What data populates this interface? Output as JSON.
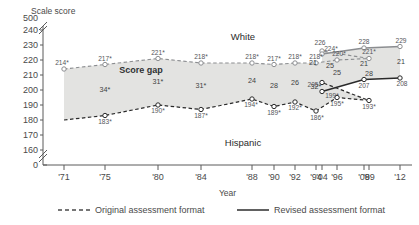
{
  "chart_data": {
    "type": "line",
    "title": "",
    "ylabel": "Scale score",
    "xlabel": "Year",
    "ylim": [
      160,
      240
    ],
    "yticks": [
      "500",
      "240",
      "230",
      "220",
      "210",
      "200",
      "190",
      "180",
      "170",
      "160",
      "0"
    ],
    "axis_break_top": true,
    "axis_break_bottom": true,
    "grid": false,
    "categories": [
      "'71",
      "'75",
      "'80",
      "'84",
      "'88",
      "'90",
      "'92",
      "'94",
      "'96",
      "'99",
      "'04",
      "'04",
      "'08",
      "'12"
    ],
    "xticks": [
      "'71",
      "'75",
      "'80",
      "'84",
      "'88",
      "'90",
      "'92",
      "'94",
      "'96",
      "'99",
      "'04",
      "'08",
      "'12"
    ],
    "series": [
      {
        "name": "White",
        "format": "original",
        "style": "dashed",
        "x": [
          "'71",
          "'75",
          "'80",
          "'84",
          "'88",
          "'90",
          "'92",
          "'94",
          "'96",
          "'99",
          "'04"
        ],
        "values": [
          214,
          217,
          221,
          218,
          218,
          217,
          218,
          218,
          220,
          221,
          226
        ],
        "labels": [
          "214*",
          "217*",
          "221*",
          "218*",
          "218*",
          "217*",
          "218*",
          "218*",
          "220*",
          "221*",
          "226"
        ]
      },
      {
        "name": "White",
        "format": "revised",
        "style": "solid",
        "x": [
          "'04",
          "'08",
          "'12"
        ],
        "values": [
          224,
          228,
          229
        ],
        "labels": [
          "224*",
          "228",
          "229"
        ]
      },
      {
        "name": "Hispanic",
        "format": "original",
        "style": "dashed",
        "x": [
          "'71",
          "'75",
          "'80",
          "'84",
          "'88",
          "'90",
          "'92",
          "'94",
          "'96",
          "'99",
          "'04"
        ],
        "values": [
          180,
          183,
          190,
          187,
          194,
          189,
          192,
          186,
          195,
          193,
          205
        ],
        "labels": [
          "",
          "183*",
          "190*",
          "187*",
          "194*",
          "189*",
          "192*",
          "186*",
          "195*",
          "193*",
          "205"
        ]
      },
      {
        "name": "Hispanic",
        "format": "revised",
        "style": "solid",
        "x": [
          "'04",
          "'08",
          "'12"
        ],
        "values": [
          199,
          207,
          208
        ],
        "labels": [
          "199*",
          "207",
          "208"
        ]
      }
    ],
    "gap_band_label": "Score gap",
    "gap_labels_original": [
      "34*",
      "31*",
      "31*",
      "24",
      "28",
      "26",
      "32*",
      "25",
      "28",
      "21"
    ],
    "gap_labels_revised": [
      "25",
      "21",
      "21"
    ],
    "annotations": [
      {
        "text": "White",
        "role": "upper-series-label"
      },
      {
        "text": "Hispanic",
        "role": "lower-series-label"
      },
      {
        "text": "Score gap",
        "role": "band-label"
      }
    ],
    "legend": {
      "position": "bottom",
      "entries": [
        {
          "label": "Original assessment format",
          "style": "dashed"
        },
        {
          "label": "Revised assessment format",
          "style": "solid"
        }
      ]
    },
    "colors": {
      "band_fill": "#e3e3e1",
      "band_stroke": "#b9b9b7",
      "white_line": "#8b8d90",
      "hispanic_line": "#2a2a2a",
      "axis": "#5a5a5a",
      "text": "#4a4a4a"
    }
  }
}
